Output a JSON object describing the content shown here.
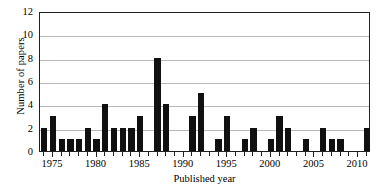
{
  "chart_data": {
    "type": "bar",
    "title": "",
    "xlabel": "Published year",
    "ylabel": "Number of papers",
    "xlim": [
      1973.5,
      2011.5
    ],
    "ylim": [
      0,
      12
    ],
    "ytick_values": [
      0,
      2,
      4,
      6,
      8,
      10,
      12
    ],
    "ytick_labels": [
      "0",
      "2",
      "4",
      "6",
      "8",
      "10",
      "12"
    ],
    "xtick_values": [
      1975,
      1980,
      1985,
      1990,
      1995,
      2000,
      2005,
      2010
    ],
    "xtick_labels": [
      "1975",
      "1980",
      "1985",
      "1990",
      "1995",
      "2000",
      "2005",
      "2010"
    ],
    "grid": "horizontal",
    "legend": "none",
    "bar_color": "#101010",
    "grid_color": "#b9b9b9",
    "axis_color": "#231f20",
    "categories": [
      1974,
      1975,
      1976,
      1977,
      1978,
      1979,
      1980,
      1981,
      1982,
      1983,
      1984,
      1985,
      1986,
      1987,
      1988,
      1989,
      1990,
      1991,
      1992,
      1993,
      1994,
      1995,
      1996,
      1997,
      1998,
      1999,
      2000,
      2001,
      2002,
      2003,
      2004,
      2005,
      2006,
      2007,
      2008,
      2009,
      2010,
      2011
    ],
    "values": [
      2,
      3,
      1,
      1,
      1,
      2,
      1,
      4,
      2,
      2,
      2,
      3,
      0,
      8,
      4,
      0,
      0,
      3,
      5,
      0,
      1,
      3,
      0,
      1,
      2,
      0,
      1,
      3,
      2,
      0,
      1,
      0,
      2,
      1,
      1,
      0,
      0,
      2
    ],
    "series": [
      {
        "name": "Number of papers",
        "values": [
          2,
          3,
          1,
          1,
          1,
          2,
          1,
          4,
          2,
          2,
          2,
          3,
          0,
          8,
          4,
          0,
          0,
          3,
          5,
          0,
          1,
          3,
          0,
          1,
          2,
          0,
          1,
          3,
          2,
          0,
          1,
          0,
          2,
          1,
          1,
          0,
          0,
          2
        ]
      }
    ]
  }
}
